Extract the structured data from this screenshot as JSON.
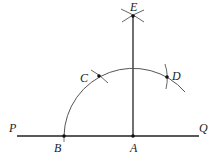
{
  "diagram": {
    "type": "geometric-construction",
    "stroke_color": "#222222",
    "arc_color": "#555555",
    "labels": {
      "P": "P",
      "Q": "Q",
      "A": "A",
      "B": "B",
      "C": "C",
      "D": "D",
      "E": "E"
    },
    "points": {
      "A": [
        133,
        136
      ],
      "B": [
        64,
        136
      ],
      "C": [
        99,
        76
      ],
      "D": [
        167,
        77
      ],
      "E": [
        133,
        16
      ]
    },
    "line_PQ": {
      "x1": 17,
      "x2": 199,
      "y": 136
    },
    "perpendicular_AE": {
      "x": 133,
      "y1": 16,
      "y2": 136
    },
    "arc_center": "A",
    "arc_radius": 69
  }
}
